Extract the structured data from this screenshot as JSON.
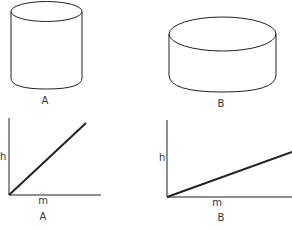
{
  "colors": {
    "background": "#ffffff",
    "stroke": "#222222",
    "text": "#333333"
  },
  "cylinders": [
    {
      "id": "A",
      "label": "A",
      "description": "tall narrow cylinder"
    },
    {
      "id": "B",
      "label": "B",
      "description": "short wide cylinder"
    }
  ],
  "graphs": [
    {
      "id": "A",
      "label": "A",
      "y_axis_label": "h",
      "x_axis_label": "m",
      "slope": "steep"
    },
    {
      "id": "B",
      "label": "B",
      "y_axis_label": "h",
      "x_axis_label": "m",
      "slope": "shallow"
    }
  ]
}
